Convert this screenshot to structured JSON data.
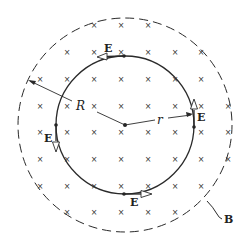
{
  "figure": {
    "center": [
      125,
      125
    ],
    "inner_radius": 69,
    "outer_radius": 107,
    "colors": {
      "line": "#2a2a2a",
      "cross": "#333333",
      "background": "#ffffff"
    }
  },
  "labels": {
    "field_E": "E",
    "radius_R": "R",
    "radius_r": "r",
    "field_B": "B"
  },
  "crosses": {
    "symbol": "×",
    "rows": [
      {
        "y": 25,
        "xs": [
          94,
          121,
          148
        ]
      },
      {
        "y": 52,
        "xs": [
          67,
          94,
          121,
          148,
          175,
          201
        ]
      },
      {
        "y": 79,
        "xs": [
          40,
          67,
          94,
          121,
          148,
          175,
          201
        ]
      },
      {
        "y": 106,
        "xs": [
          40,
          67,
          94,
          121,
          148,
          175,
          201,
          228
        ]
      },
      {
        "y": 132,
        "xs": [
          40,
          67,
          94,
          121,
          148,
          175,
          201,
          228
        ]
      },
      {
        "y": 159,
        "xs": [
          40,
          67,
          94,
          121,
          148,
          175,
          201,
          228
        ]
      },
      {
        "y": 186,
        "xs": [
          40,
          67,
          94,
          121,
          148,
          175,
          201
        ]
      },
      {
        "y": 212,
        "xs": [
          67,
          94,
          121,
          148,
          175
        ]
      }
    ]
  }
}
